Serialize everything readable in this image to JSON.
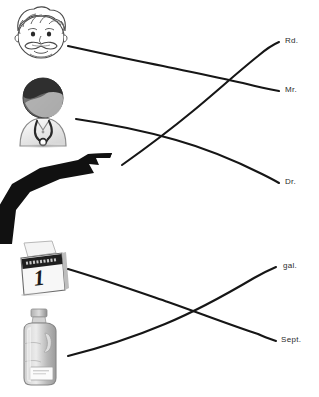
{
  "worksheet": {
    "title": "Abbreviation Matching Worksheet",
    "background_color": "#ffffff",
    "line_color": "#161616",
    "label_color": "#2b2b2b"
  },
  "groups": [
    {
      "name": "top-group",
      "prompts": [
        {
          "id": "man-face",
          "icon": "mustached-man-face-icon",
          "alt": "Cartoon face of a man with wavy hair and a mustache"
        },
        {
          "id": "doctor",
          "icon": "doctor-avatar-icon",
          "alt": "Doctor avatar wearing a stethoscope"
        },
        {
          "id": "road",
          "icon": "winding-road-icon",
          "alt": "Black winding road"
        }
      ],
      "answers": [
        {
          "id": "rd",
          "label": "Rd."
        },
        {
          "id": "mr",
          "label": "Mr."
        },
        {
          "id": "dr",
          "label": "Dr."
        }
      ],
      "connections": [
        {
          "from": "man-face",
          "to": "mr"
        },
        {
          "from": "doctor",
          "to": "dr"
        },
        {
          "from": "road",
          "to": "rd"
        }
      ]
    },
    {
      "name": "bottom-group",
      "prompts": [
        {
          "id": "calendar",
          "icon": "calendar-page-icon",
          "alt": "Desk calendar showing the number 1",
          "calendar_day": "1",
          "calendar_month": "SEPTEMBER"
        },
        {
          "id": "milk-jug",
          "icon": "milk-gallon-jug-icon",
          "alt": "Plastic gallon milk jug"
        }
      ],
      "answers": [
        {
          "id": "gal",
          "label": "gal."
        },
        {
          "id": "sept",
          "label": "Sept."
        }
      ],
      "connections": [
        {
          "from": "calendar",
          "to": "sept"
        },
        {
          "from": "milk-jug",
          "to": "gal"
        }
      ]
    }
  ],
  "labels": {
    "rd": "Rd.",
    "mr": "Mr.",
    "dr": "Dr.",
    "gal": "gal.",
    "sept": "Sept."
  },
  "calendar": {
    "day": "1",
    "month": "SEPTEMBER"
  }
}
